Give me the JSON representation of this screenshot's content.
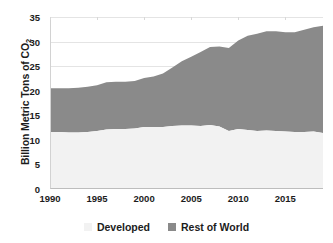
{
  "chart_data": {
    "type": "area",
    "title": "",
    "xlabel": "",
    "ylabel": "Billion Metric Tons of CO2",
    "ylabel_display": "Billion Metric Tons of CO",
    "ylabel_sub": "2",
    "stacked": true,
    "grid": true,
    "legend_position": "bottom",
    "xlim": [
      1990,
      2019
    ],
    "ylim": [
      0,
      35
    ],
    "ytick_labels": [
      "0",
      "5",
      "10",
      "15",
      "20",
      "25",
      "30",
      "35"
    ],
    "ytick_values": [
      0,
      5,
      10,
      15,
      20,
      25,
      30,
      35
    ],
    "xtick_labels": [
      "1990",
      "1995",
      "2000",
      "2005",
      "2010",
      "2015"
    ],
    "xtick_values": [
      1990,
      1995,
      2000,
      2005,
      2010,
      2015
    ],
    "x": [
      1990,
      1991,
      1992,
      1993,
      1994,
      1995,
      1996,
      1997,
      1998,
      1999,
      2000,
      2001,
      2002,
      2003,
      2004,
      2005,
      2006,
      2007,
      2008,
      2009,
      2010,
      2011,
      2012,
      2013,
      2014,
      2015,
      2016,
      2017,
      2018,
      2019
    ],
    "series": [
      {
        "name": "Developed",
        "color": "#f2f2f2",
        "values": [
          11.6,
          11.6,
          11.5,
          11.5,
          11.6,
          11.8,
          12.1,
          12.2,
          12.2,
          12.3,
          12.6,
          12.6,
          12.6,
          12.8,
          12.9,
          12.9,
          12.8,
          13.0,
          12.7,
          11.8,
          12.2,
          12.0,
          11.8,
          11.9,
          11.8,
          11.7,
          11.6,
          11.6,
          11.7,
          11.4
        ]
      },
      {
        "name": "Rest of World",
        "color": "#8a8a8a",
        "values": [
          8.9,
          8.9,
          9.0,
          9.1,
          9.2,
          9.3,
          9.6,
          9.6,
          9.6,
          9.7,
          10.0,
          10.3,
          10.9,
          11.9,
          13.1,
          14.0,
          15.1,
          15.9,
          16.3,
          16.9,
          18.0,
          19.2,
          19.8,
          20.2,
          20.3,
          20.2,
          20.3,
          20.8,
          21.2,
          21.8
        ]
      }
    ],
    "total": [
      20.5,
      20.5,
      20.5,
      20.6,
      20.8,
      21.1,
      21.7,
      21.8,
      21.8,
      22.0,
      22.6,
      22.9,
      23.5,
      24.7,
      26.0,
      26.9,
      27.9,
      28.9,
      29.0,
      28.7,
      30.2,
      31.2,
      31.6,
      32.1,
      32.1,
      31.9,
      31.9,
      32.4,
      32.9,
      33.2
    ]
  },
  "legend": {
    "items": [
      {
        "label": "Developed",
        "color": "#f2f2f2"
      },
      {
        "label": "Rest of World",
        "color": "#8a8a8a"
      }
    ]
  }
}
